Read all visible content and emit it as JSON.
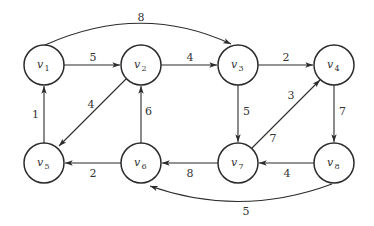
{
  "diagram": {
    "type": "directed weighted graph",
    "colors": {
      "stroke": "#2b2b2b",
      "text": "#333333",
      "background": "#ffffff"
    },
    "nodes": [
      {
        "id": "v1",
        "label": "v",
        "sub": "1",
        "x": 44,
        "y": 65
      },
      {
        "id": "v2",
        "label": "v",
        "sub": "2",
        "x": 141,
        "y": 65
      },
      {
        "id": "v3",
        "label": "v",
        "sub": "3",
        "x": 238,
        "y": 65
      },
      {
        "id": "v4",
        "label": "v",
        "sub": "4",
        "x": 334,
        "y": 65
      },
      {
        "id": "v5",
        "label": "v",
        "sub": "5",
        "x": 44,
        "y": 163
      },
      {
        "id": "v6",
        "label": "v",
        "sub": "6",
        "x": 141,
        "y": 163
      },
      {
        "id": "v7",
        "label": "v",
        "sub": "7",
        "x": 238,
        "y": 163
      },
      {
        "id": "v8",
        "label": "v",
        "sub": "8",
        "x": 334,
        "y": 163
      }
    ],
    "edges": [
      {
        "from": "v1",
        "to": "v2",
        "weight": "5"
      },
      {
        "from": "v1",
        "to": "v3",
        "weight": "8"
      },
      {
        "from": "v2",
        "to": "v3",
        "weight": "4"
      },
      {
        "from": "v2",
        "to": "v5",
        "weight": "4"
      },
      {
        "from": "v3",
        "to": "v4",
        "weight": "2"
      },
      {
        "from": "v3",
        "to": "v7",
        "weight": "5"
      },
      {
        "from": "v4",
        "to": "v8",
        "weight": "7"
      },
      {
        "from": "v5",
        "to": "v1",
        "weight": "1"
      },
      {
        "from": "v6",
        "to": "v2",
        "weight": "6"
      },
      {
        "from": "v6",
        "to": "v5",
        "weight": "2"
      },
      {
        "from": "v7",
        "to": "v6",
        "weight": "8"
      },
      {
        "from": "v7",
        "to": "v4",
        "weight": "3"
      },
      {
        "from": "v7",
        "to": "v4",
        "weight_lower": "7"
      },
      {
        "from": "v8",
        "to": "v7",
        "weight": "4"
      },
      {
        "from": "v8",
        "to": "v6",
        "weight": "5"
      }
    ],
    "edge_labels": {
      "v1_v2": "5",
      "v1_v3": "8",
      "v2_v3": "4",
      "v2_v5": "4",
      "v3_v4": "2",
      "v3_v7": "5",
      "v4_v8": "7",
      "v5_v1": "1",
      "v6_v2": "6",
      "v6_v5": "2",
      "v7_v6": "8",
      "v7_v4_upper": "3",
      "v7_v4_lower": "7",
      "v8_v7": "4",
      "v8_v6": "5"
    }
  }
}
